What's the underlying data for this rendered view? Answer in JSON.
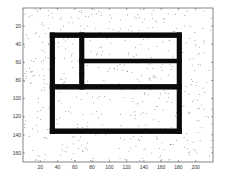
{
  "chart_data": {
    "type": "scatter",
    "title": "",
    "xlabel": "",
    "ylabel": "",
    "xlim": [
      0,
      220
    ],
    "ylim": [
      0,
      170
    ],
    "y_reversed": true,
    "grid": false,
    "legend": null,
    "xticks": [
      20,
      40,
      60,
      80,
      100,
      120,
      140,
      160,
      180,
      200
    ],
    "yticks": [
      20,
      40,
      60,
      80,
      100,
      120,
      140,
      160
    ],
    "walls": [
      {
        "name": "outer-top",
        "x0": 31,
        "x1": 184,
        "y0": 27,
        "y1": 33
      },
      {
        "name": "outer-bottom",
        "x0": 31,
        "x1": 184,
        "y0": 133,
        "y1": 139
      },
      {
        "name": "outer-left",
        "x0": 31,
        "x1": 37,
        "y0": 27,
        "y1": 139
      },
      {
        "name": "outer-right",
        "x0": 178,
        "x1": 184,
        "y0": 27,
        "y1": 139
      },
      {
        "name": "inner-vertical",
        "x0": 65,
        "x1": 71,
        "y0": 27,
        "y1": 90
      },
      {
        "name": "inner-horizontal-upper",
        "x0": 65,
        "x1": 184,
        "y0": 56,
        "y1": 61
      },
      {
        "name": "inner-horizontal-middle",
        "x0": 31,
        "x1": 184,
        "y0": 84,
        "y1": 90
      }
    ],
    "noise": {
      "count": 520,
      "color": "#555555",
      "seed": 7
    }
  },
  "colors": {
    "background": "#ffffff",
    "axes": "#333333",
    "walls": "#0a0a0a",
    "noise": "#555555"
  }
}
